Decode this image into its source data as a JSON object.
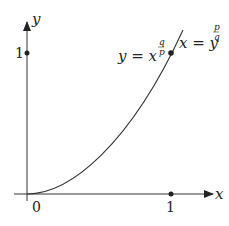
{
  "diagram": {
    "axes": {
      "x_label": "x",
      "y_label": "y",
      "origin_label": "0",
      "x_tick_label": "1",
      "y_tick_label": "1"
    },
    "curve": {
      "label_left": {
        "base": "y = x",
        "exp_num": "q",
        "exp_den": "p"
      },
      "label_right": {
        "base": "x = y",
        "exp_num": "p",
        "exp_den": "q"
      },
      "marked_point": "(1, 1)"
    },
    "colors": {
      "stroke": "#222222",
      "background": "#ffffff"
    }
  }
}
